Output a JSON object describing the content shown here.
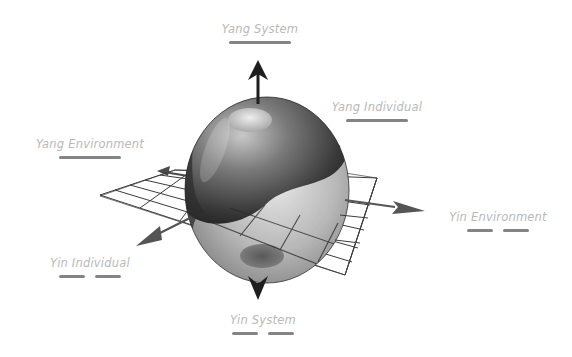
{
  "diagram": {
    "title": "",
    "center": {
      "shape": "sphere",
      "pattern": "yin-yang",
      "description": "3D sphere with yin-yang swirl on a grid plane"
    },
    "axes": [
      {
        "id": "yang_system",
        "label": "Yang System",
        "direction": "up",
        "polarity": "yang",
        "line_style": "solid"
      },
      {
        "id": "yin_system",
        "label": "Yin System",
        "direction": "down",
        "polarity": "yin",
        "line_style": "broken"
      },
      {
        "id": "yang_individual",
        "label": "Yang Individual",
        "direction": "back-right",
        "polarity": "yang",
        "line_style": "solid"
      },
      {
        "id": "yin_individual",
        "label": "Yin Individual",
        "direction": "front-left",
        "polarity": "yin",
        "line_style": "broken"
      },
      {
        "id": "yang_environment",
        "label": "Yang Environment",
        "direction": "back-left",
        "polarity": "yang",
        "line_style": "solid"
      },
      {
        "id": "yin_environment",
        "label": "Yin Environment",
        "direction": "front-right",
        "polarity": "yin",
        "line_style": "broken"
      }
    ],
    "colors": {
      "background": "#ffffff",
      "label_text": "#b9b9b9",
      "bar": "#6f6f6f",
      "arrow_vertical": "#1e1e1e",
      "arrow_horizontal": "#4a4a4a",
      "grid": "#3a3a3a"
    }
  }
}
